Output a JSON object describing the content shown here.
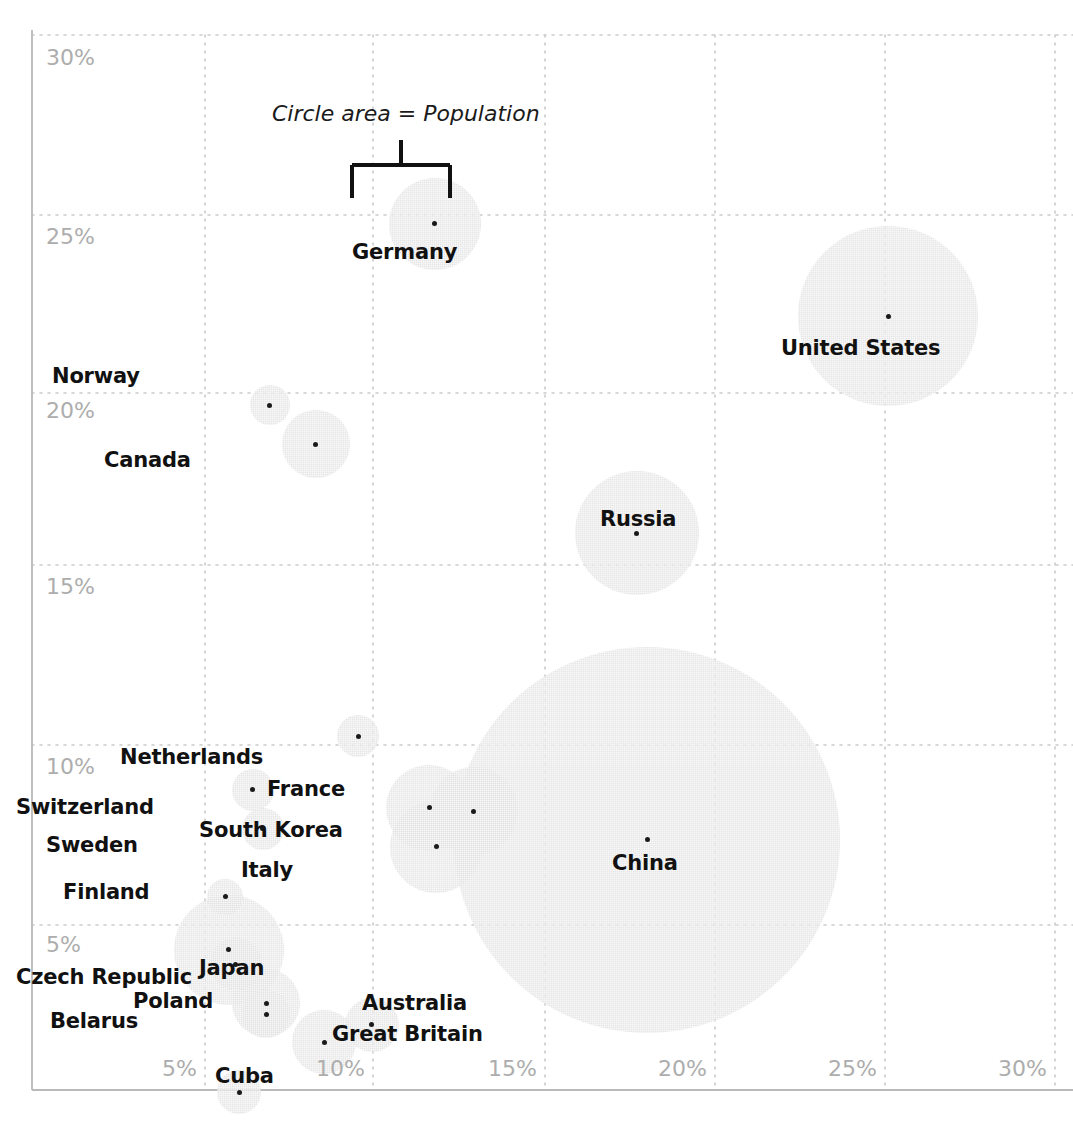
{
  "chart_data": {
    "type": "scatter",
    "title": "",
    "subtitle": "",
    "xlabel": "",
    "ylabel": "",
    "xlim": [
      0,
      31
    ],
    "ylim": [
      0,
      31
    ],
    "grid": true,
    "legend": "none",
    "annotation": "Circle area = Population",
    "size_encoding": "Circle area = Population",
    "xticks": [
      "5%",
      "10%",
      "15%",
      "20%",
      "25%",
      "30%"
    ],
    "xtick_values": [
      5,
      10,
      15,
      20,
      25,
      30
    ],
    "yticks": [
      "5%",
      "10%",
      "15%",
      "20%",
      "25%",
      "30%"
    ],
    "ytick_values": [
      5,
      10,
      15,
      20,
      25,
      30
    ],
    "points": [
      {
        "label": "Germany",
        "x": 11.75,
        "y": 24.7,
        "r": 46,
        "lx": 352,
        "ly": 240
      },
      {
        "label": "United States",
        "x": 25.1,
        "y": 22.1,
        "r": 90,
        "lx": 781,
        "ly": 336
      },
      {
        "label": "Norway",
        "x": 6.9,
        "y": 19.6,
        "r": 20,
        "lx": 52,
        "ly": 364
      },
      {
        "label": "Canada",
        "x": 8.25,
        "y": 18.5,
        "r": 34,
        "lx": 104,
        "ly": 448
      },
      {
        "label": "Russia",
        "x": 17.7,
        "y": 16.0,
        "r": 62,
        "lx": 600,
        "ly": 507
      },
      {
        "label": "China",
        "x": 18.0,
        "y": 7.4,
        "r": 193,
        "lx": 612,
        "ly": 851
      },
      {
        "label": "Netherlands",
        "x": 9.5,
        "y": 10.3,
        "r": 21,
        "lx": 120,
        "ly": 745
      },
      {
        "label": "Switzerland",
        "x": 6.4,
        "y": 8.8,
        "r": 21,
        "lx": 16,
        "ly": 795
      },
      {
        "label": "Sweden",
        "x": 6.7,
        "y": 7.7,
        "r": 21,
        "lx": 46,
        "ly": 833
      },
      {
        "label": "Finland",
        "x": 5.6,
        "y": 5.8,
        "r": 18,
        "lx": 63,
        "ly": 880
      },
      {
        "label": "France",
        "x": 12.9,
        "y": 8.2,
        "r": 44,
        "lx": 267,
        "ly": 777
      },
      {
        "label": "South Korea",
        "x": 11.6,
        "y": 8.3,
        "r": 43,
        "lx": 199,
        "ly": 818
      },
      {
        "label": "Italy",
        "x": 11.8,
        "y": 7.2,
        "r": 46,
        "lx": 241,
        "ly": 858
      },
      {
        "label": "Japan",
        "x": 5.7,
        "y": 4.3,
        "r": 55,
        "lx": 199,
        "ly": 956
      },
      {
        "label": "Czech Republic",
        "x": 5.9,
        "y": 3.9,
        "r": 26,
        "lx": 16,
        "ly": 965
      },
      {
        "label": "Poland",
        "x": 6.8,
        "y": 2.8,
        "r": 34,
        "lx": 133,
        "ly": 989
      },
      {
        "label": "Belarus",
        "x": 6.8,
        "y": 2.5,
        "r": 24,
        "lx": 50,
        "ly": 1009
      },
      {
        "label": "Australia",
        "x": 9.9,
        "y": 2.2,
        "r": 27,
        "lx": 362,
        "ly": 991
      },
      {
        "label": "Great Britain",
        "x": 8.5,
        "y": 1.7,
        "r": 32,
        "lx": 332,
        "ly": 1022
      },
      {
        "label": "Cuba",
        "x": 6.0,
        "y": 0.3,
        "r": 22,
        "lx": 215,
        "ly": 1064
      }
    ]
  },
  "axis": {
    "x_tick_positions_px": [
      205,
      373,
      545,
      715,
      885,
      1055
    ],
    "y_tick_positions_px": [
      925,
      745,
      565,
      393,
      215,
      35
    ]
  },
  "xticks_render": [
    {
      "text": "5%",
      "x": 162,
      "y": 1056
    },
    {
      "text": "10%",
      "x": 316,
      "y": 1056
    },
    {
      "text": "15%",
      "x": 488,
      "y": 1056
    },
    {
      "text": "20%",
      "x": 658,
      "y": 1056
    },
    {
      "text": "25%",
      "x": 828,
      "y": 1056
    },
    {
      "text": "30%",
      "x": 998,
      "y": 1056
    }
  ],
  "yticks_render": [
    {
      "text": "30%",
      "x": 46,
      "y": 45
    },
    {
      "text": "25%",
      "x": 46,
      "y": 224
    },
    {
      "text": "20%",
      "x": 46,
      "y": 398
    },
    {
      "text": "15%",
      "x": 46,
      "y": 574
    },
    {
      "text": "10%",
      "x": 46,
      "y": 754
    },
    {
      "text": "5%",
      "x": 46,
      "y": 932
    }
  ],
  "annotation": {
    "text": "Circle area = Population",
    "x": 272,
    "y": 101
  }
}
